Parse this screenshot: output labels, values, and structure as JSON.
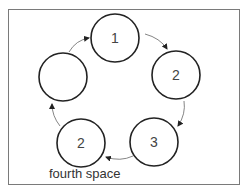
{
  "diagram": {
    "type": "cycle",
    "direction": "clockwise",
    "nodes": [
      {
        "id": "n1",
        "label": "1",
        "cx": 115,
        "cy": 38
      },
      {
        "id": "n2",
        "label": "2",
        "cx": 176,
        "cy": 75
      },
      {
        "id": "n3",
        "label": "3",
        "cx": 154,
        "cy": 142
      },
      {
        "id": "n4",
        "label": "2",
        "cx": 81,
        "cy": 143
      },
      {
        "id": "n5",
        "label": "",
        "cx": 63,
        "cy": 77
      }
    ],
    "edges": [
      {
        "from": "n1",
        "to": "n2"
      },
      {
        "from": "n2",
        "to": "n3"
      },
      {
        "from": "n3",
        "to": "n4"
      },
      {
        "from": "n4",
        "to": "n5"
      },
      {
        "from": "n5",
        "to": "n1"
      }
    ],
    "caption": "fourth space",
    "colors": {
      "circle_stroke": "#222222",
      "arrow": "#555555",
      "frame": "#7a7a7a",
      "text": "#444444"
    }
  }
}
